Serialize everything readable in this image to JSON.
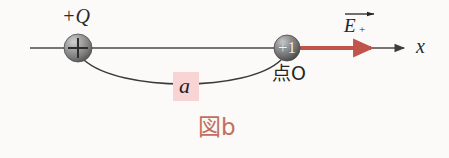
{
  "figure": {
    "caption": "図b",
    "caption_color": "#c1705f",
    "background_color": "#fbfaf8"
  },
  "axis": {
    "name": "x",
    "color": "#4a4a4a",
    "y_position": 48,
    "start_x": 30,
    "end_x": 405
  },
  "charges": {
    "source": {
      "label_above": "+Q",
      "sign_glyph": "+",
      "center_x": 78,
      "center_y": 48,
      "radius": 14,
      "fill": "#8d8d8d"
    },
    "test": {
      "label_below": "点O",
      "value_text": "+1",
      "center_x": 287,
      "center_y": 48,
      "radius": 13,
      "fill": "#7e7e7e"
    }
  },
  "field_vector": {
    "symbol": "E",
    "subscript": "+",
    "color": "#c0544a",
    "start_x": 300,
    "end_x": 374,
    "y_position": 48
  },
  "distance": {
    "symbol": "a",
    "highlight_color": "#f9d4d4",
    "arc_low_y": 88
  }
}
